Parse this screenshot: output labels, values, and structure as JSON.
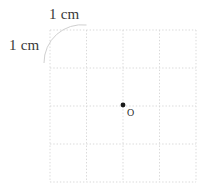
{
  "figure": {
    "background_color": "#ffffff",
    "width": 210,
    "height": 196
  },
  "grid": {
    "columns": 4,
    "rows": 4,
    "line_color": "#d9d9d9",
    "line_style": "dotted",
    "left": 50,
    "top": 30,
    "right": 196,
    "bottom": 182,
    "cell_width": 36.5,
    "cell_height": 38,
    "x_lines": [
      50,
      86.5,
      123,
      159.5,
      196
    ],
    "y_lines": [
      30,
      68,
      106,
      144,
      182
    ]
  },
  "annotations": {
    "top_label": "1 cm",
    "left_label": "1 cm",
    "arc_color": "#d0d0d0"
  },
  "point": {
    "label": "O",
    "dot_x": 123,
    "dot_y": 105,
    "dot_radius": 2.4,
    "dot_color": "#1a1a1a",
    "marker_x": 131,
    "marker_y": 114,
    "marker_radius": 3.2,
    "marker_color": "#2b2b2b"
  }
}
